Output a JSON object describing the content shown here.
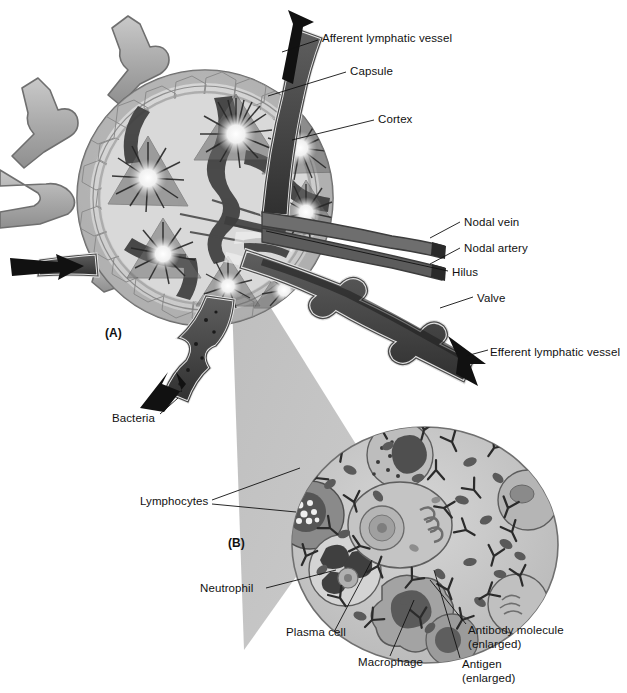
{
  "figure": {
    "panels": [
      {
        "id": "A",
        "marker": "(A)",
        "x": 105,
        "y": 326
      },
      {
        "id": "B",
        "marker": "(B)",
        "x": 228,
        "y": 536
      }
    ]
  },
  "labels": {
    "afferent_lymphatic_vessel": "Afferent lymphatic vessel",
    "capsule": "Capsule",
    "cortex": "Cortex",
    "nodal_vein": "Nodal vein",
    "nodal_artery": "Nodal artery",
    "hilus": "Hilus",
    "valve": "Valve",
    "efferent_lymphatic_vessel": "Efferent lymphatic vessel",
    "bacteria": "Bacteria",
    "lymphocytes": "Lymphocytes",
    "neutrophil": "Neutrophil",
    "plasma_cell": "Plasma cell",
    "macrophage": "Macrophage",
    "antibody_molecule": "Antibody molecule",
    "antibody_molecule_sub": "(enlarged)",
    "antigen": "Antigen",
    "antigen_sub": "(enlarged)"
  },
  "colors": {
    "ink": "#111111",
    "capsule_fill": "#cfcfcf",
    "capsule_edge": "#6e6e6e",
    "cortex_fill": "#d8d8d8",
    "follicle_dark": "#4a4a4a",
    "germinal_center": "#f2f2f2",
    "vessel_light": "#b3b3b3",
    "vessel_dark": "#4f4f4f",
    "vessel_black": "#262626",
    "cone_gray": "#b8b8b8",
    "cell_cytoplasm": "#c8c8c8",
    "cell_membrane": "#8c8c8c",
    "lymphocyte_fill": "#8f8f8f",
    "macrophage_fill": "#9c9c9c",
    "antibody": "#2b2b2b",
    "antigen_dot": "#5c5c5c",
    "background": "#ffffff"
  },
  "label_positions": {
    "afferent_lymphatic_vessel": {
      "x": 322,
      "y": 38
    },
    "capsule": {
      "x": 350,
      "y": 71
    },
    "cortex": {
      "x": 378,
      "y": 119
    },
    "nodal_vein": {
      "x": 464,
      "y": 223
    },
    "nodal_artery": {
      "x": 464,
      "y": 248
    },
    "hilus": {
      "x": 452,
      "y": 272
    },
    "valve": {
      "x": 477,
      "y": 298
    },
    "efferent_lymphatic_vessel": {
      "x": 490,
      "y": 352
    },
    "bacteria": {
      "x": 123,
      "y": 418
    },
    "lymphocytes": {
      "x": 140,
      "y": 501
    },
    "neutrophil": {
      "x": 209,
      "y": 589
    },
    "plasma_cell": {
      "x": 308,
      "y": 638
    },
    "macrophage": {
      "x": 360,
      "y": 662
    },
    "antibody_molecule": {
      "x": 470,
      "y": 630
    },
    "antigen": {
      "x": 464,
      "y": 663
    }
  }
}
